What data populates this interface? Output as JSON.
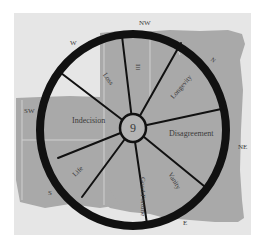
{
  "diagram": {
    "type": "wheel",
    "hub_label": "9",
    "compass": {
      "W": "W",
      "NW": "NW",
      "N": "N",
      "NE": "NE",
      "E": "E",
      "S": "S",
      "SW": "SW"
    },
    "segments": {
      "loss": "Loss",
      "ill": "Ill",
      "longevity": "Longevity",
      "indecision": "Indecision",
      "disagreement": "Disagreement",
      "life": "Life",
      "good_fortune": "Good Fortune",
      "vanity": "Vanity"
    },
    "colors": {
      "panel": "#e6e6e6",
      "map_fill": "#a9a9a9",
      "rim": "#111111",
      "text": "#3a3a3a"
    }
  }
}
